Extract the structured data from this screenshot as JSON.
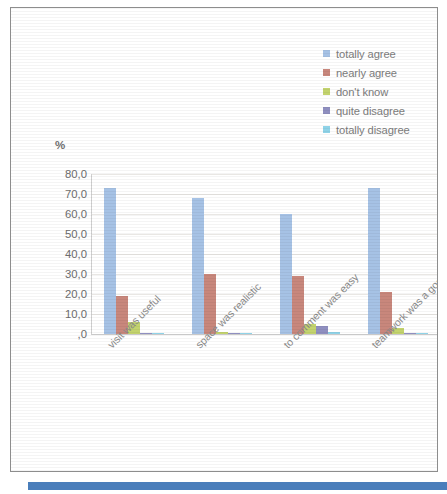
{
  "chart_data": {
    "type": "bar",
    "title": "",
    "subtitle": "",
    "xlabel": "",
    "ylabel": "%",
    "ylim": [
      0,
      80
    ],
    "grid": true,
    "legend_position": "top-right",
    "ytick_labels": [
      "80,0",
      "70,0",
      "60,0",
      "50,0",
      "40,0",
      "30,0",
      "20,0",
      "10,0",
      ",0"
    ],
    "ytick_values": [
      80,
      70,
      60,
      50,
      40,
      30,
      20,
      10,
      0
    ],
    "categories": [
      "visit was useful",
      "space was realistic",
      "to comment was easy",
      "teamwork was a good choise"
    ],
    "series": [
      {
        "name": "totally agree",
        "color": "#a6c2e5",
        "values": [
          73,
          68,
          60,
          73
        ]
      },
      {
        "name": "nearly agree",
        "color": "#c8877c",
        "values": [
          19,
          30,
          29,
          21
        ]
      },
      {
        "name": "don't know",
        "color": "#c3d36e",
        "values": [
          6,
          1,
          5,
          3
        ]
      },
      {
        "name": "quite disagree",
        "color": "#8f8fc0",
        "values": [
          0,
          0,
          4,
          0
        ]
      },
      {
        "name": "totally disagree",
        "color": "#8fd3e8",
        "values": [
          0,
          0,
          1,
          0
        ]
      }
    ]
  },
  "legend": {
    "items": [
      {
        "label": "totally agree"
      },
      {
        "label": "nearly agree"
      },
      {
        "label": "don't know"
      },
      {
        "label": "quite disagree"
      },
      {
        "label": "totally disagree"
      }
    ]
  },
  "axis": {
    "percent_symbol": "%"
  }
}
